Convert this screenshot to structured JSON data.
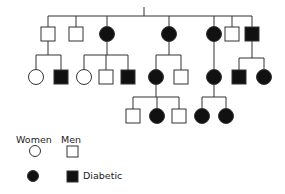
{
  "diagram": {
    "type": "pedigree",
    "colors": {
      "line": "#333333",
      "affected": "#111111",
      "unaffected": "#ffffff"
    },
    "generations": [
      {
        "label": "I",
        "members": []
      },
      {
        "label": "II",
        "members": [
          {
            "id": "II-1",
            "sex": "male",
            "affected": false
          },
          {
            "id": "II-2",
            "sex": "male",
            "affected": false
          },
          {
            "id": "II-3",
            "sex": "female",
            "affected": true
          },
          {
            "id": "II-4",
            "sex": "female",
            "affected": true
          },
          {
            "id": "II-5",
            "sex": "female",
            "affected": true
          },
          {
            "id": "II-6",
            "sex": "male",
            "affected": false,
            "note": "spouse"
          },
          {
            "id": "II-7",
            "sex": "male",
            "affected": true
          }
        ]
      },
      {
        "label": "III",
        "members": [
          {
            "id": "III-1",
            "sex": "female",
            "affected": false,
            "parent": "II-1"
          },
          {
            "id": "III-2",
            "sex": "male",
            "affected": true,
            "parent": "II-1"
          },
          {
            "id": "III-3",
            "sex": "female",
            "affected": false,
            "parent": "II-3"
          },
          {
            "id": "III-4",
            "sex": "male",
            "affected": false,
            "parent": "II-3"
          },
          {
            "id": "III-5",
            "sex": "male",
            "affected": true,
            "parent": "II-3"
          },
          {
            "id": "III-6",
            "sex": "female",
            "affected": true,
            "parent": "II-4"
          },
          {
            "id": "III-7",
            "sex": "male",
            "affected": false,
            "parent": "II-4"
          },
          {
            "id": "III-8",
            "sex": "female",
            "affected": true,
            "parent": "II-5"
          },
          {
            "id": "III-9",
            "sex": "male",
            "affected": true,
            "parent": "II-7"
          },
          {
            "id": "III-10",
            "sex": "female",
            "affected": true,
            "parent": "II-7"
          }
        ]
      },
      {
        "label": "IV",
        "members": [
          {
            "id": "IV-1",
            "sex": "male",
            "affected": false,
            "parent": "III-6"
          },
          {
            "id": "IV-2",
            "sex": "female",
            "affected": true,
            "parent": "III-6"
          },
          {
            "id": "IV-3",
            "sex": "male",
            "affected": false,
            "parent": "III-6"
          },
          {
            "id": "IV-4",
            "sex": "female",
            "affected": true,
            "parent": "III-8"
          },
          {
            "id": "IV-5",
            "sex": "female",
            "affected": true,
            "parent": "III-8"
          }
        ]
      }
    ]
  },
  "legend": {
    "women_label": "Women",
    "men_label": "Men",
    "diabetic_label": "Diabetic"
  }
}
